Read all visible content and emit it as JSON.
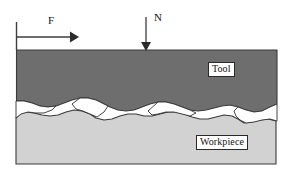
{
  "figure": {
    "background_color": "#ffffff"
  },
  "labels": {
    "tool": "Tool",
    "workpiece": "Workpiece",
    "force_tangential": "F",
    "force_normal": "N"
  },
  "colors": {
    "tool_fill": "#6e6e6e",
    "workpiece_fill": "#d2d2d2",
    "outline": "#3a3a3a",
    "void_fill": "#ffffff",
    "arrow": "#333333",
    "label_border": "#2a2a2a",
    "label_background": "#ffffff",
    "text": "#111111"
  },
  "diagram_data": {
    "type": "schematic",
    "description": "Cross-sectional schematic of a tool pressed onto a workpiece, showing a rough asperity contact interface with entrapped voids. A tangential force F acts horizontally on the tool and a normal force N acts vertically downward onto the tool top surface.",
    "bodies": [
      {
        "name": "Tool",
        "fill": "#6e6e6e",
        "role": "upper-body",
        "label": "Tool"
      },
      {
        "name": "Workpiece",
        "fill": "#d2d2d2",
        "role": "lower-body",
        "label": "Workpiece"
      }
    ],
    "forces": [
      {
        "symbol": "F",
        "direction": "horizontal-right",
        "applied_to": "Tool",
        "description": "tangential / friction driving force"
      },
      {
        "symbol": "N",
        "direction": "vertical-down",
        "applied_to": "Tool",
        "description": "normal load"
      }
    ],
    "interface": {
      "character": "rough asperity contact",
      "void_count": 4,
      "void_fill": "#ffffff"
    }
  }
}
